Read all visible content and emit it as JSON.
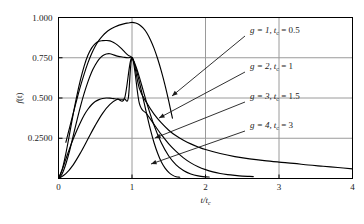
{
  "chart_data": {
    "type": "line",
    "title": "",
    "xlabel": "t/t_c",
    "ylabel": "f(t)",
    "xlim": [
      0,
      4
    ],
    "ylim": [
      0,
      1.0
    ],
    "grid": true,
    "legend_position": "inside-right",
    "xticks": [
      "0",
      "1",
      "2",
      "3",
      "4"
    ],
    "xtick_values": [
      0,
      1,
      2,
      3,
      4
    ],
    "yticks": [
      "0.2500",
      "0.500",
      "0.750",
      "1.000"
    ],
    "ytick_values": [
      0.25,
      0.5,
      0.75,
      1.0
    ],
    "crossing_point": {
      "x": 1,
      "y": 0.75
    },
    "series": [
      {
        "name": "g = 1, t_c = 0.5",
        "g": 1,
        "tc": 0.5,
        "peak": {
          "x": 0.93,
          "y": 0.5
        },
        "x": [
          0.0,
          0.05,
          0.1,
          0.15,
          0.2,
          0.25,
          0.3,
          0.35,
          0.4,
          0.45,
          0.5,
          0.55,
          0.6,
          0.65,
          0.7,
          0.75,
          0.8,
          0.85,
          0.9,
          0.95,
          1.0,
          1.1,
          1.2,
          1.3,
          1.4,
          1.5,
          1.6,
          1.7,
          1.8,
          1.9,
          2.0,
          2.2,
          2.4,
          2.6,
          2.8,
          3.0,
          3.2,
          3.4,
          3.6,
          3.8,
          4.0
        ],
        "y": [
          0.0,
          0.055,
          0.12,
          0.185,
          0.245,
          0.3,
          0.35,
          0.395,
          0.43,
          0.458,
          0.478,
          0.49,
          0.497,
          0.5,
          0.499,
          0.496,
          0.493,
          0.492,
          0.494,
          0.5,
          0.75,
          0.56,
          0.47,
          0.4,
          0.345,
          0.3,
          0.265,
          0.238,
          0.215,
          0.196,
          0.18,
          0.155,
          0.136,
          0.122,
          0.111,
          0.102,
          0.094,
          0.084,
          0.076,
          0.068,
          0.06
        ]
      },
      {
        "name": "g = 2, t_c = 1",
        "g": 2,
        "tc": 1,
        "peak": {
          "x": 0.9,
          "y": 0.5
        },
        "x": [
          0.0,
          0.1,
          0.2,
          0.3,
          0.4,
          0.5,
          0.6,
          0.7,
          0.8,
          0.9,
          1.0,
          1.1,
          1.2,
          1.3,
          1.4,
          1.5,
          1.6,
          1.7,
          1.8,
          1.9,
          2.0,
          2.1,
          2.2,
          2.3,
          2.4,
          2.5,
          2.6,
          2.65
        ],
        "y": [
          0.0,
          0.03,
          0.085,
          0.16,
          0.245,
          0.33,
          0.405,
          0.46,
          0.492,
          0.5,
          0.75,
          0.466,
          0.402,
          0.336,
          0.272,
          0.215,
          0.168,
          0.128,
          0.097,
          0.073,
          0.055,
          0.041,
          0.031,
          0.024,
          0.019,
          0.015,
          0.013,
          0.012
        ]
      },
      {
        "name": "g = 3, t_c = 1.5",
        "g": 3,
        "tc": 1.5,
        "peak": {
          "x": 0.8,
          "y": 0.775
        },
        "x": [
          0.0,
          0.05,
          0.1,
          0.15,
          0.2,
          0.25,
          0.3,
          0.35,
          0.4,
          0.45,
          0.5,
          0.55,
          0.6,
          0.65,
          0.7,
          0.75,
          0.8,
          0.85,
          0.9,
          0.95,
          1.0,
          1.05,
          1.1,
          1.15,
          1.2,
          1.3,
          1.4,
          1.5,
          1.6,
          1.7,
          1.8,
          1.9,
          2.0,
          2.05
        ],
        "y": [
          0.0,
          0.03,
          0.09,
          0.17,
          0.265,
          0.36,
          0.45,
          0.53,
          0.6,
          0.66,
          0.705,
          0.74,
          0.762,
          0.773,
          0.775,
          0.768,
          0.76,
          0.756,
          0.752,
          0.75,
          0.75,
          0.7,
          0.63,
          0.55,
          0.47,
          0.33,
          0.22,
          0.14,
          0.085,
          0.05,
          0.028,
          0.016,
          0.01,
          0.009
        ]
      },
      {
        "name": "g = 4, t_c = 3",
        "g": 4,
        "tc": 3,
        "peak": {
          "x": 0.7,
          "y": 0.855
        },
        "x": [
          0.0,
          0.05,
          0.1,
          0.15,
          0.2,
          0.25,
          0.3,
          0.35,
          0.4,
          0.45,
          0.5,
          0.55,
          0.6,
          0.65,
          0.7,
          0.75,
          0.8,
          0.85,
          0.9,
          0.95,
          1.0,
          1.05,
          1.1,
          1.15,
          1.2,
          1.25,
          1.3,
          1.35,
          1.4,
          1.45,
          1.5,
          1.55,
          1.6,
          1.65
        ],
        "y": [
          0.0,
          0.055,
          0.155,
          0.275,
          0.4,
          0.515,
          0.615,
          0.7,
          0.765,
          0.81,
          0.838,
          0.852,
          0.856,
          0.857,
          0.855,
          0.845,
          0.83,
          0.81,
          0.786,
          0.765,
          0.75,
          0.69,
          0.6,
          0.5,
          0.4,
          0.305,
          0.222,
          0.155,
          0.102,
          0.064,
          0.038,
          0.021,
          0.011,
          0.008
        ]
      },
      {
        "name": "steep-rising-curve",
        "is_annotation_curve": true,
        "x": [
          0.1,
          0.15,
          0.2,
          0.25,
          0.3,
          0.35,
          0.4,
          0.45,
          0.5,
          0.55,
          0.6,
          0.65,
          0.7,
          0.75,
          0.8,
          0.85,
          0.9,
          0.95,
          1.0,
          1.05,
          1.1,
          1.15,
          1.2,
          1.25,
          1.3,
          1.35,
          1.4,
          1.45,
          1.5,
          1.55
        ],
        "y": [
          0.225,
          0.315,
          0.405,
          0.492,
          0.575,
          0.65,
          0.718,
          0.775,
          0.822,
          0.858,
          0.886,
          0.908,
          0.925,
          0.938,
          0.948,
          0.956,
          0.962,
          0.966,
          0.97,
          0.966,
          0.955,
          0.935,
          0.905,
          0.862,
          0.808,
          0.742,
          0.665,
          0.578,
          0.48,
          0.375
        ]
      }
    ],
    "annotations": [
      {
        "label": "g = 1, t_c = 0.5",
        "label_html": "g = 1, t",
        "sub": "c",
        "tail": " = 0.5",
        "text_x": 250,
        "text_y": 33,
        "arrow_from_x": 245,
        "arrow_from_y": 36,
        "arrow_to_x": 172,
        "arrow_to_y": 96
      },
      {
        "label": "g = 2, t_c = 1",
        "text_x": 250,
        "text_y": 69,
        "arrow_from_x": 245,
        "arrow_from_y": 72,
        "arrow_to_x": 159,
        "arrow_to_y": 118
      },
      {
        "label": "g = 3, t_c = 1.5",
        "text_x": 250,
        "text_y": 99,
        "arrow_from_x": 245,
        "arrow_from_y": 102,
        "arrow_to_x": 155,
        "arrow_to_y": 138
      },
      {
        "label": "g = 4, t_c = 3",
        "text_x": 250,
        "text_y": 128,
        "arrow_from_x": 245,
        "arrow_from_y": 131,
        "arrow_to_x": 151,
        "arrow_to_y": 164
      }
    ],
    "legend_entries": [
      {
        "g_text": "g = 1,",
        "t_text": "t",
        "sub_text": "c",
        "eq_text": " = 0.5"
      },
      {
        "g_text": "g = 2,",
        "t_text": "t",
        "sub_text": "c",
        "eq_text": " = 1"
      },
      {
        "g_text": "g = 3,",
        "t_text": "t",
        "sub_text": "c",
        "eq_text": " = 1.5"
      },
      {
        "g_text": "g = 4,",
        "t_text": "t",
        "sub_text": "c",
        "eq_text": " = 3"
      }
    ],
    "colors": {
      "curve": "#000000",
      "frame": "#000000",
      "grid": "#9a9a9a",
      "text": "#1a1a1a",
      "background": "#ffffff"
    }
  },
  "axes": {
    "y_label_main": "f",
    "y_label_paren": "(t)",
    "x_label_main": "t/t",
    "x_label_sub": "c"
  }
}
